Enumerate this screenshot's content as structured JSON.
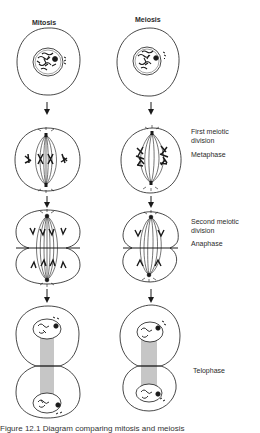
{
  "diagram": {
    "columns": [
      {
        "id": "mitosis",
        "title": "Mitosis"
      },
      {
        "id": "meiosis",
        "title": "Meiosis"
      }
    ],
    "stage_labels": [
      {
        "id": "first-division",
        "lines": [
          "First meiotic",
          "division"
        ]
      },
      {
        "id": "metaphase",
        "text": "Metaphase"
      },
      {
        "id": "second-division",
        "lines": [
          "Second meiotic",
          "division"
        ]
      },
      {
        "id": "anaphase",
        "text": "Anaphase"
      },
      {
        "id": "telophase",
        "text": "Telophase"
      }
    ],
    "rows": [
      "Interphase",
      "Metaphase",
      "Anaphase",
      "Telophase"
    ],
    "caption_partial": "Figure 12.1  Diagram comparing mitosis and meiosis"
  },
  "colors": {
    "ink": "#1a1a1a",
    "background": "#ffffff"
  }
}
